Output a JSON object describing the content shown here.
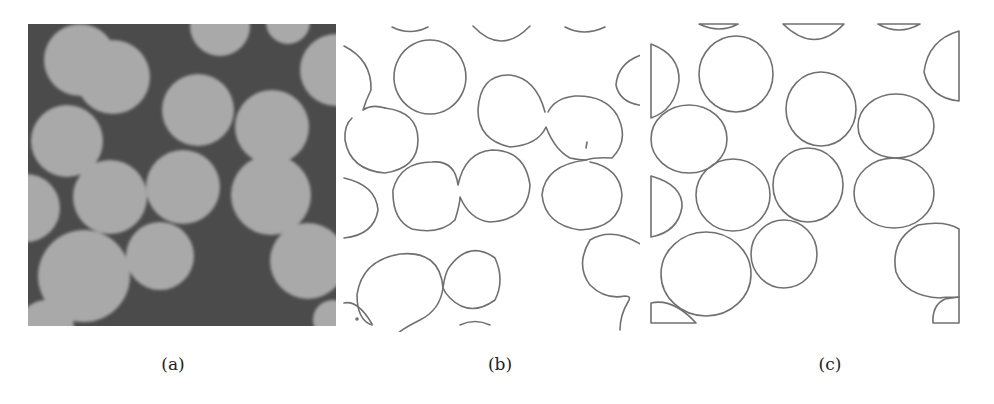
{
  "figure": {
    "panels": [
      {
        "id": "a",
        "caption": "(a)",
        "type": "grayscale-micrograph"
      },
      {
        "id": "b",
        "caption": "(b)",
        "type": "edge-contours"
      },
      {
        "id": "c",
        "caption": "(c)",
        "type": "separated-circle-contours"
      }
    ]
  },
  "colors": {
    "background_a": "#4b4b4b",
    "particle_a": "#a9a9a9",
    "contour": "#6e6e6e",
    "caption": "#222222"
  },
  "particles": [
    {
      "cx": 80,
      "cy": 60,
      "r": 36
    },
    {
      "cx": 220,
      "cy": 26,
      "r": 30
    },
    {
      "cx": 288,
      "cy": 22,
      "r": 22
    },
    {
      "cx": 336,
      "cy": 70,
      "r": 36
    },
    {
      "cx": 113,
      "cy": 77,
      "r": 37
    },
    {
      "cx": 198,
      "cy": 110,
      "r": 36
    },
    {
      "cx": 272,
      "cy": 127,
      "r": 37
    },
    {
      "cx": 67,
      "cy": 141,
      "r": 36
    },
    {
      "cx": 110,
      "cy": 197,
      "r": 37
    },
    {
      "cx": 183,
      "cy": 187,
      "r": 37
    },
    {
      "cx": 271,
      "cy": 195,
      "r": 40
    },
    {
      "cx": 26,
      "cy": 208,
      "r": 34
    },
    {
      "cx": 84,
      "cy": 276,
      "r": 46
    },
    {
      "cx": 160,
      "cy": 256,
      "r": 34
    },
    {
      "cx": 308,
      "cy": 261,
      "r": 38
    },
    {
      "cx": 46,
      "cy": 328,
      "r": 28
    },
    {
      "cx": 333,
      "cy": 320,
      "r": 20
    }
  ]
}
